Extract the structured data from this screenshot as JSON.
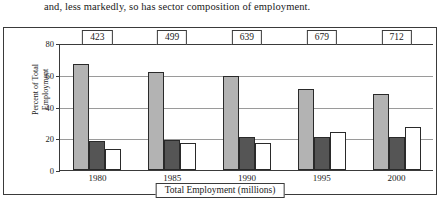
{
  "caption": "and, less markedly, so has sector composition of employment.",
  "chart_data": {
    "type": "bar",
    "title": "",
    "xlabel": "Total Employment (millions)",
    "ylabel": "Percent of Total\nEmployment",
    "ylim": [
      0,
      80
    ],
    "yticks": [
      0,
      20,
      40,
      60,
      80
    ],
    "grid": true,
    "legend_position": "bottom",
    "categories": [
      "1980",
      "1985",
      "1990",
      "1995",
      "2000"
    ],
    "series": [
      {
        "name": "Primary",
        "color": "#b3b3b3",
        "values": [
          67,
          62,
          59,
          51,
          48
        ]
      },
      {
        "name": "Secondary",
        "color": "#555555",
        "values": [
          18,
          19,
          21,
          21,
          21
        ]
      },
      {
        "name": "Tertiary",
        "color": "#ffffff",
        "values": [
          13,
          17,
          17,
          24,
          27
        ]
      }
    ],
    "annotations": {
      "label": "Total Employment (millions)",
      "values": [
        "423",
        "499",
        "639",
        "679",
        "712"
      ]
    }
  }
}
